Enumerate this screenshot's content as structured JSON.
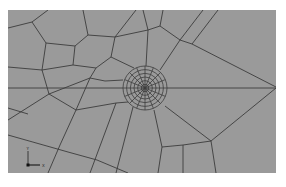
{
  "viewer": {
    "background_color": "#9a9a9a",
    "mesh_color": "#3c3c3c",
    "mesh_type": "quadrilateral finite-element mesh with radial refinement around a point"
  },
  "refinement": {
    "rings": 6,
    "rays": 16
  },
  "triad": {
    "y_label": "Y",
    "x_label": "X"
  }
}
